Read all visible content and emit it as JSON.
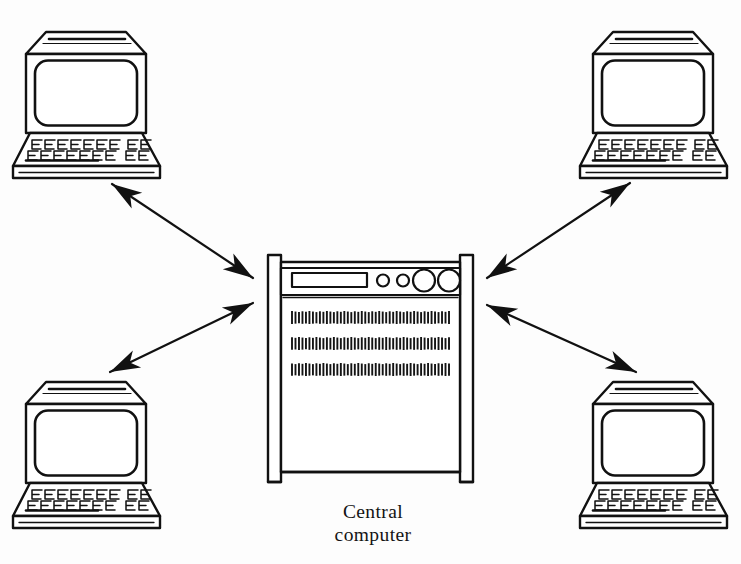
{
  "diagram": {
    "background_color": "#fdfdfd",
    "ink_color": "#111111",
    "style": "scanned line art",
    "caption": {
      "line1": "Central",
      "line2": "computer",
      "full_text": "Central computer"
    },
    "central_node": {
      "name": "Central computer",
      "type": "mainframe-cabinet",
      "control_panel": {
        "slot_count": 1,
        "small_dials": 2,
        "large_dials": 2
      },
      "vent_rows": 3,
      "vent_ticks_per_row": 46
    },
    "terminals": [
      {
        "id": "terminal-top-left",
        "label": "",
        "position": "top-left"
      },
      {
        "id": "terminal-top-right",
        "label": "",
        "position": "top-right"
      },
      {
        "id": "terminal-bottom-left",
        "label": "",
        "position": "bottom-left"
      },
      {
        "id": "terminal-bottom-right",
        "label": "",
        "position": "bottom-right"
      }
    ],
    "connections": [
      {
        "id": "link-top-left",
        "from": "Central computer",
        "to": "terminal-top-left",
        "arrow": "double-headed"
      },
      {
        "id": "link-top-right",
        "from": "Central computer",
        "to": "terminal-top-right",
        "arrow": "double-headed"
      },
      {
        "id": "link-bottom-left",
        "from": "Central computer",
        "to": "terminal-bottom-left",
        "arrow": "double-headed"
      },
      {
        "id": "link-bottom-right",
        "from": "Central computer",
        "to": "terminal-bottom-right",
        "arrow": "double-headed"
      }
    ]
  }
}
